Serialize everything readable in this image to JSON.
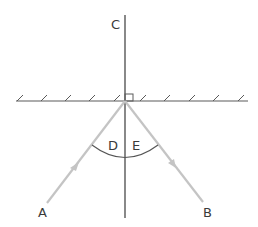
{
  "diagram": {
    "labels": {
      "normal": "C",
      "incident_ray": "A",
      "reflected_ray": "B",
      "angle_incidence": "D",
      "angle_reflection": "E"
    },
    "colors": {
      "background": "#ffffff",
      "mirror": "#5a5a5a",
      "normal": "#3a3a3a",
      "ray": "#c4c4c4",
      "arc": "#555555",
      "text": "#3a3a3a"
    },
    "elements": [
      "plane mirror (hatched line)",
      "normal line C perpendicular to mirror",
      "right-angle marker at point of incidence",
      "incident ray from A with arrow toward mirror",
      "reflected ray toward B with arrow",
      "angle arc spanning D and E"
    ]
  }
}
